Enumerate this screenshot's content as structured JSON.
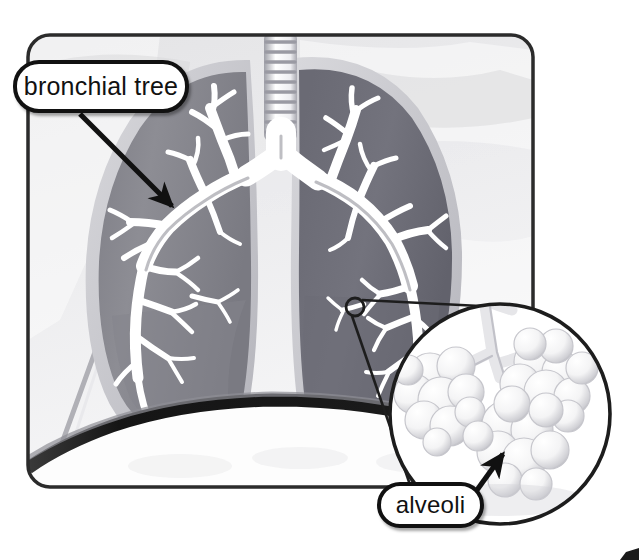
{
  "figure": {
    "background_color": "#ffffff",
    "frame": {
      "border_color": "#2b2b2b",
      "fill_color": "#ebebeb",
      "x": 28,
      "y": 35,
      "width": 505,
      "height": 452,
      "corner_radius": 22
    },
    "colors": {
      "outline": "#111111",
      "lung_left_fill": "#8a8a90",
      "lung_right_fill": "#70707a",
      "lung_rim": "#c9c9cf",
      "airway_light": "#ffffff",
      "airway_shadow": "#9a9aa2",
      "background_pale": "#e8e8ea",
      "background_white": "#fafafa",
      "diaphragm": "#1d1d1d"
    }
  },
  "labels": [
    {
      "id": "bronchial-tree",
      "text": "bronchial tree",
      "shape": "rounded-rect-callout",
      "border_color": "#111111",
      "fill_color": "#ffffff",
      "pointer": {
        "type": "arrow",
        "from_x": 80,
        "from_y": 114,
        "to_x": 177,
        "to_y": 211
      }
    },
    {
      "id": "alveoli",
      "text": "alveoli",
      "shape": "rounded-rect-callout",
      "border_color": "#111111",
      "fill_color": "#ffffff",
      "pointer": {
        "type": "arrow",
        "from_x": 479,
        "from_y": 487,
        "to_x": 506,
        "to_y": 449
      }
    }
  ],
  "anatomy": {
    "trachea": {
      "label": "trachea",
      "rings": 11,
      "x": 264,
      "y": 33,
      "width": 33,
      "height": 104
    },
    "carina": {
      "label": "carina",
      "x": 280,
      "y": 150
    },
    "left_lung": {
      "label": "left lung (viewer left)",
      "fill": "#8a8a90"
    },
    "right_lung": {
      "label": "right lung (viewer right)",
      "fill": "#70707a"
    },
    "diaphragm": {
      "label": "diaphragm",
      "fill": "#1d1d1d"
    }
  },
  "magnifier": {
    "id": "alveoli-inset",
    "shape": "circle",
    "center_x": 500,
    "center_y": 414,
    "radius": 112,
    "border_color": "#1d1d1d",
    "fill_color": "#ffffff",
    "source_marker": {
      "shape": "small-circle",
      "center_x": 355,
      "center_y": 307,
      "radius": 9,
      "border_color": "#1d1d1d"
    },
    "connector_lines": 2,
    "contents": "cluster of grape-like alveolar sacs at the end of a bronchiole"
  }
}
